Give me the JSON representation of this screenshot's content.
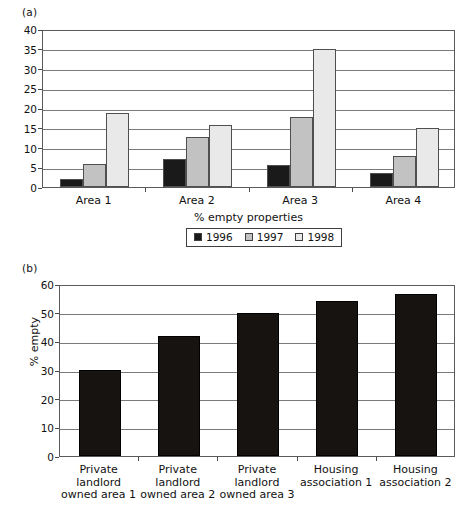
{
  "figure": {
    "panel_a_label": "(a)",
    "panel_b_label": "(b)"
  },
  "chart_data": [
    {
      "id": "chart-a",
      "type": "bar",
      "title": "",
      "xlabel": "% empty properties",
      "ylabel": "",
      "categories": [
        "Area 1",
        "Area 2",
        "Area 3",
        "Area 4"
      ],
      "series": [
        {
          "name": "1996",
          "color": "#1a1a1a",
          "values": [
            2.1,
            7.0,
            5.7,
            3.6
          ]
        },
        {
          "name": "1997",
          "color": "#c2c2c2",
          "values": [
            5.9,
            12.7,
            17.7,
            7.8
          ]
        },
        {
          "name": "1998",
          "color": "#e9e9e9",
          "values": [
            18.7,
            15.7,
            35.0,
            15.0
          ]
        }
      ],
      "ylim": [
        0,
        40
      ],
      "yticks": [
        0,
        5,
        10,
        15,
        20,
        25,
        30,
        35,
        40
      ],
      "grid": true,
      "legend_position": "bottom"
    },
    {
      "id": "chart-b",
      "type": "bar",
      "title": "",
      "xlabel": "",
      "ylabel": "% empty",
      "categories": [
        "Private\nlandlord\nowned area 1",
        "Private\nlandlord\nowned area 2",
        "Private\nlandlord\nowned area 3",
        "Housing\nassociation 1",
        "Housing\nassociation 2"
      ],
      "values": [
        29.9,
        42.0,
        49.8,
        54.2,
        56.4
      ],
      "bar_color": "#161310",
      "ylim": [
        0,
        60
      ],
      "yticks": [
        0,
        10,
        20,
        30,
        40,
        50,
        60
      ],
      "grid": true,
      "legend_position": "none"
    }
  ]
}
